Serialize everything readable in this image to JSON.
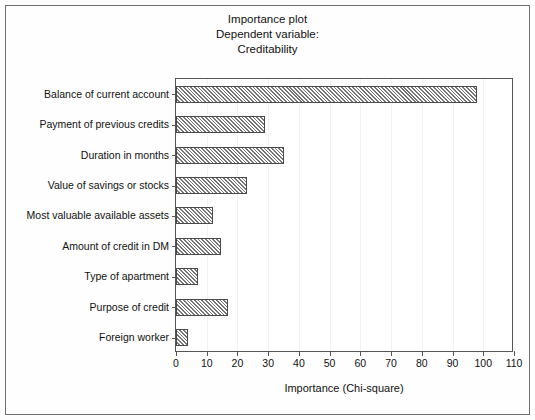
{
  "figure": {
    "title_lines": [
      "Importance plot",
      "Dependent variable:",
      "Creditability"
    ],
    "frame_color": "#6e6e6e",
    "bar_fill": "#c9c9c9",
    "bar_edge": "#4a4a4a"
  },
  "chart_data": {
    "type": "bar",
    "orientation": "horizontal",
    "xlabel": "Importance (Chi-square)",
    "ylabel": "",
    "xlim": [
      0,
      110
    ],
    "xticks": [
      0,
      10,
      20,
      30,
      40,
      50,
      60,
      70,
      80,
      90,
      100,
      110
    ],
    "xtick_labels": [
      "0",
      "10",
      "20",
      "30",
      "40",
      "50",
      "60",
      "70",
      "80",
      "90",
      "100",
      "110"
    ],
    "grid": false,
    "legend": null,
    "categories": [
      "Balance of current account",
      "Payment of previous credits",
      "Duration in months",
      "Value of savings or stocks",
      "Most valuable available assets",
      "Amount of credit in DM",
      "Type of apartment",
      "Purpose of credit",
      "Foreign worker"
    ],
    "values": [
      98,
      29,
      35,
      23,
      12,
      14.5,
      7,
      17,
      4
    ]
  }
}
